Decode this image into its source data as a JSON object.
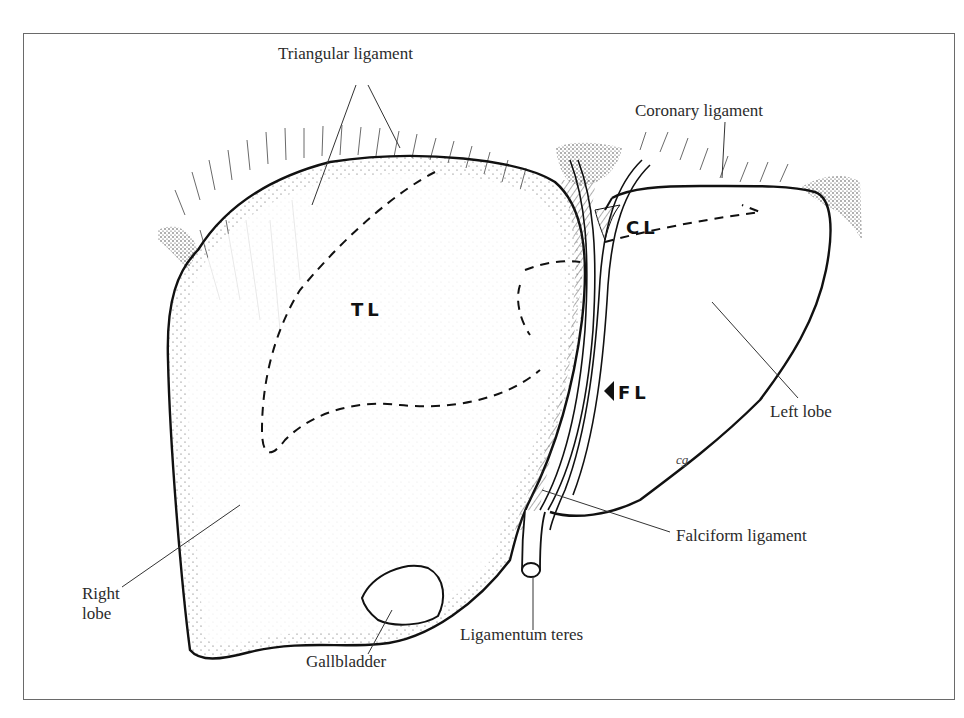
{
  "diagram": {
    "labels": {
      "triangular_ligament": "Triangular ligament",
      "coronary_ligament": "Coronary ligament",
      "left_lobe": "Left lobe",
      "falciform_ligament": "Falciform ligament",
      "ligamentum_teres": "Ligamentum teres",
      "gallbladder": "Gallbladder",
      "right_lobe_line1": "Right",
      "right_lobe_line2": "lobe"
    },
    "region_abbreviations": {
      "tl": "TL",
      "cl": "CL",
      "fl": "FL"
    },
    "artist_signature": "cg",
    "colors": {
      "outline": "#111111",
      "label_text": "#2b2b2b",
      "frame": "#6a6a6a",
      "stipple": "#555555",
      "background": "#ffffff"
    }
  }
}
